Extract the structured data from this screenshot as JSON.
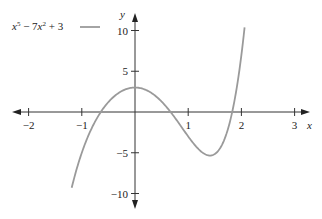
{
  "chart_data": {
    "type": "line",
    "title": "",
    "legend": [
      {
        "label_html": "x^5 − 7x^2 + 3",
        "color": "#9a9a9a"
      }
    ],
    "legend_text": {
      "base1": "x",
      "sup1": "5",
      "mid": " − 7",
      "base2": "x",
      "sup2": "2",
      "tail": " + 3"
    },
    "xlabel": "x",
    "ylabel": "y",
    "xlim": [
      -2.3,
      3.3
    ],
    "ylim": [
      -12,
      12
    ],
    "x_ticks": [
      -2,
      -1,
      1,
      2,
      3
    ],
    "x_tick_labels": [
      "−2",
      "−1",
      "1",
      "2",
      "3"
    ],
    "y_ticks": [
      10,
      5,
      -5,
      -10
    ],
    "y_tick_labels": [
      "10",
      "5",
      "−5",
      "−10"
    ],
    "grid": false,
    "legend_position": "top-left",
    "series": [
      {
        "name": "x^5 − 7x^2 + 3",
        "function": "x^5 - 7*x^2 + 3",
        "domain": [
          -1.19,
          2.06
        ],
        "x": [
          -1.19,
          -1.0,
          -0.8,
          -0.6,
          -0.4,
          -0.2,
          0.0,
          0.2,
          0.4,
          0.6,
          0.8,
          1.0,
          1.2,
          1.4,
          1.6,
          1.8,
          2.0,
          2.06
        ],
        "y": [
          -9.3,
          -5.0,
          -1.8,
          0.4,
          1.9,
          2.7,
          3.0,
          2.7,
          1.9,
          0.6,
          -1.2,
          -3.0,
          -4.6,
          -5.3,
          -4.4,
          -0.8,
          7.0,
          10.4
        ]
      }
    ]
  }
}
